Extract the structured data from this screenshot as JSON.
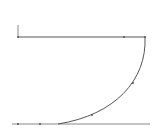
{
  "diagram": {
    "background": "#ffffff",
    "stroke_color": "#555555",
    "line_color_light": "#888888",
    "top_line": {
      "x1": 18,
      "y1": 37,
      "x2": 145,
      "y2": 37
    },
    "axis_tick": {
      "x1": 18,
      "y1": 37,
      "x2": 18,
      "y2": 25
    },
    "curve": {
      "d": "M145 37 C147 80 115 115 58 124"
    },
    "bottom_line": {
      "x1": 12,
      "y1": 124,
      "x2": 150,
      "y2": 124
    },
    "points": [
      {
        "x": 18,
        "y": 37
      },
      {
        "x": 124,
        "y": 37
      },
      {
        "x": 145,
        "y": 37
      },
      {
        "x": 133,
        "y": 83
      },
      {
        "x": 92,
        "y": 115
      },
      {
        "x": 40,
        "y": 124
      },
      {
        "x": 18,
        "y": 124
      }
    ]
  }
}
